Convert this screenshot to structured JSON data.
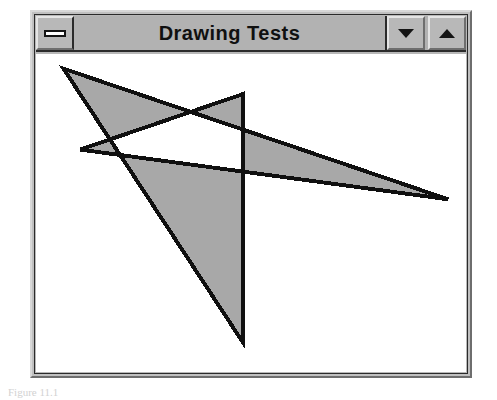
{
  "window": {
    "title": "Drawing Tests",
    "controls": {
      "restore_label": "Restore",
      "minimize_label": "Minimize",
      "maximize_label": "Maximize",
      "restore_icon": "restore-bar-icon",
      "minimize_icon": "triangle-down-icon",
      "maximize_icon": "triangle-up-icon"
    },
    "colors": {
      "titlebar_bg": "#b2b2b2",
      "frame_bg": "#c0c0c0",
      "client_bg": "#ffffff",
      "title_text": "#101010",
      "shape_fill": "#a8a8a8",
      "shape_stroke": "#101010"
    }
  },
  "caption": {
    "text": "Figure 11.1"
  },
  "chart_data": {
    "type": "scatter",
    "title": "Drawing Tests",
    "xlabel": "",
    "ylabel": "",
    "subtitle": "Self-intersecting filled polygon (alternate fill mode)",
    "grid": false,
    "legend": "none",
    "canvas": {
      "width": 438,
      "height": 326,
      "background": "#ffffff"
    },
    "shapes": [
      {
        "name": "self-intersecting-polygon",
        "kind": "polygon",
        "fill": "#a8a8a8",
        "fill_rule": "evenodd",
        "stroke": "#101010",
        "stroke_width": 4,
        "closed": true,
        "points": [
          [
            28,
            15
          ],
          [
            420,
            149
          ],
          [
            45,
            98
          ],
          [
            211,
            41
          ],
          [
            211,
            296
          ]
        ]
      }
    ],
    "vertex_labels": [
      "top-left",
      "right-tip",
      "left-sliver-tip",
      "upper-peak",
      "bottom-point"
    ]
  }
}
